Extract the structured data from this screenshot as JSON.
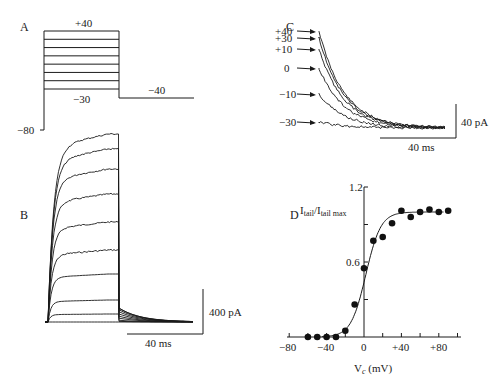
{
  "figure": {
    "panels": {
      "A": {
        "label": "A",
        "title": "Voltage protocol",
        "top_label": "+40",
        "bottom_step_label": "−30",
        "tail_label": "−40",
        "holding_label": "−80",
        "step_levels_mV": [
          -30,
          -20,
          -10,
          0,
          10,
          20,
          30,
          40
        ]
      },
      "B": {
        "label": "B",
        "scale_current": "400 pA",
        "scale_time": "40 ms",
        "trace_count": 9
      },
      "C": {
        "label": "C",
        "trace_labels": [
          "+40",
          "+30",
          "+10",
          "0",
          "−10",
          "−30"
        ],
        "scale_current": "40 pA",
        "scale_time": "40 ms"
      },
      "D": {
        "label": "D",
        "ylabel_main": "I",
        "ylabel_sub1": "tail",
        "ylabel_sep": "/I",
        "ylabel_sub2": "tail max",
        "xlabel_main": "V",
        "xlabel_sub": "c",
        "xlabel_unit": " (mV)",
        "yticks": [
          "1.2",
          "0.6"
        ],
        "xticks": [
          "−80",
          "−40",
          "0",
          "+40",
          "+80"
        ]
      }
    }
  },
  "chart_data": {
    "type": "scatter",
    "xlabel": "Vc (mV)",
    "ylabel": "Itail/Itail max",
    "xlim": [
      -80,
      100
    ],
    "ylim": [
      0,
      1.2
    ],
    "xticks": [
      -80,
      -40,
      0,
      40,
      80
    ],
    "yticks": [
      0.6,
      1.2
    ],
    "grid": false,
    "series": [
      {
        "name": "data",
        "x": [
          -60,
          -50,
          -40,
          -30,
          -20,
          -10,
          0,
          10,
          20,
          30,
          40,
          50,
          60,
          70,
          80,
          90
        ],
        "y": [
          0,
          0,
          0,
          0,
          0.05,
          0.26,
          0.55,
          0.77,
          0.8,
          0.91,
          1.01,
          0.96,
          1.0,
          1.02,
          1.0,
          1.01
        ]
      },
      {
        "name": "Boltzmann fit",
        "type": "line",
        "v_half_mV": 2,
        "slope_mV": 8,
        "max": 1.0
      }
    ]
  }
}
